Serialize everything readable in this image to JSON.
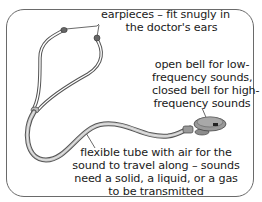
{
  "diagram": {
    "colors": {
      "frame": "#6a6a6a",
      "tube_outline": "#555555",
      "tube_fill": "#c8c8c8",
      "bell": "#8a8a8a",
      "text": "#1a1a1a"
    },
    "labels": {
      "earpieces": {
        "lines": [
          "earpieces – fit snugly in",
          "the doctor's ears"
        ]
      },
      "bell": {
        "lines": [
          "open bell for low-",
          "frequency sounds,",
          "closed bell for high-",
          "frequency sounds"
        ]
      },
      "tube": {
        "lines": [
          "flexible tube with air for the",
          "sound to travel along – sounds",
          "need a solid, a liquid, or a gas",
          "to be transmitted"
        ]
      }
    }
  }
}
